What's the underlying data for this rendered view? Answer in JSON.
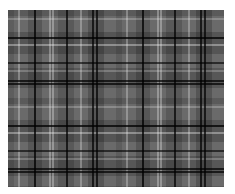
{
  "image": {
    "description": "Grayscale plaid / tartan fabric pattern",
    "colors": {
      "background": "#ffffff",
      "base": "#6a6a6a",
      "dark_lines": "#111111",
      "light_lines": "#c8c8c8"
    }
  }
}
